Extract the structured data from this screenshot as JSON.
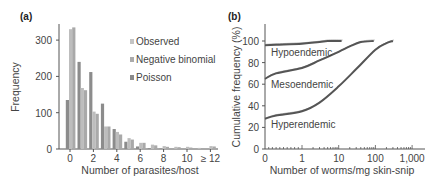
{
  "chart_data": [
    {
      "panel": "(a)",
      "type": "bar",
      "title": "",
      "xlabel": "Number of parasites/host",
      "ylabel": "Frequency",
      "ylim": [
        0,
        360
      ],
      "yticks": [
        0,
        100,
        200,
        300
      ],
      "xtick_labels": [
        "0",
        "2",
        "4",
        "6",
        "8",
        "10",
        "≥ 12"
      ],
      "categories": [
        "0",
        "1",
        "2",
        "3",
        "4",
        "5",
        "6",
        "7",
        "8",
        "9",
        "10",
        "11",
        "≥12"
      ],
      "legend": {
        "position": "upper right",
        "entries": [
          "Observed",
          "Negative binomial",
          "Poisson"
        ]
      },
      "grid": false,
      "series": [
        {
          "name": "Poisson",
          "color": "#8c8c8c",
          "values": [
            135,
            240,
            212,
            125,
            55,
            20,
            7,
            2,
            1,
            0,
            0,
            0,
            0
          ]
        },
        {
          "name": "Observed",
          "color": "#bdbdbd",
          "values": [
            330,
            168,
            103,
            62,
            47,
            30,
            17,
            12,
            8,
            6,
            6,
            3,
            8
          ]
        },
        {
          "name": "Negative binomial",
          "color": "#a9a9a9",
          "values": [
            335,
            162,
            97,
            62,
            40,
            26,
            17,
            10,
            6,
            5,
            4,
            2,
            7
          ]
        }
      ]
    },
    {
      "panel": "(b)",
      "type": "line",
      "title": "",
      "xlabel": "Number of worms/mg skin-snip",
      "ylabel": "Cumulative frequency (%)",
      "xscale": "log (with 0)",
      "xticks": [
        "0",
        "1",
        "10",
        "100",
        "1,000"
      ],
      "yticks": [
        0,
        20,
        40,
        60,
        80,
        100
      ],
      "ylim": [
        0,
        110
      ],
      "grid": false,
      "annotations": [
        "Hypoendemic",
        "Mesoendemic",
        "Hyperendemic"
      ],
      "series": [
        {
          "name": "Hypoendemic",
          "x": [
            0,
            0.3,
            1,
            3,
            5,
            12
          ],
          "y": [
            96,
            96.5,
            97.5,
            99,
            100,
            100
          ]
        },
        {
          "name": "Mesoendemic",
          "x": [
            0,
            0.3,
            1,
            3,
            10,
            20,
            40,
            90
          ],
          "y": [
            65,
            70,
            75,
            82,
            90,
            95,
            99,
            100
          ]
        },
        {
          "name": "Hyperendemic",
          "x": [
            0,
            0.3,
            1,
            3,
            10,
            30,
            100,
            200,
            300
          ],
          "y": [
            28,
            31,
            35,
            43,
            58,
            74,
            92,
            98,
            100
          ]
        }
      ]
    }
  ],
  "panel_a": {
    "label": "(a)",
    "ylabel": "Frequency",
    "xlabel": "Number of parasites/host",
    "yticks": [
      "0",
      "100",
      "200",
      "300"
    ],
    "xticks": [
      "0",
      "2",
      "4",
      "6",
      "8",
      "10",
      "≥ 12"
    ],
    "legend": [
      "Observed",
      "Negative binomial",
      "Poisson"
    ]
  },
  "panel_b": {
    "label": "(b)",
    "ylabel": "Cumulative frequency (%)",
    "xlabel": "Number of worms/mg skin-snip",
    "yticks": [
      "0",
      "20",
      "40",
      "60",
      "80",
      "100"
    ],
    "xticks": [
      "0",
      "1",
      "10",
      "100",
      "1,000"
    ],
    "curve_labels": [
      "Hypoendemic",
      "Mesoendemic",
      "Hyperendemic"
    ]
  }
}
